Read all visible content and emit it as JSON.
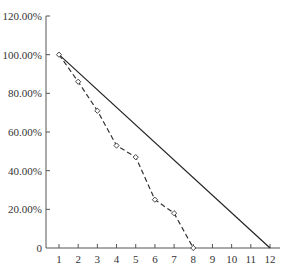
{
  "chart_data": {
    "type": "line",
    "title": "",
    "xlabel": "",
    "ylabel": "",
    "x_ticks": [
      "1",
      "2",
      "3",
      "4",
      "5",
      "6",
      "7",
      "8",
      "9",
      "10",
      "11",
      "12"
    ],
    "y_ticks": [
      "0",
      "20.00%",
      "40.00%",
      "60.00%",
      "80.00%",
      "100.00%",
      "120.00%"
    ],
    "xlim": [
      0.35,
      12.6
    ],
    "ylim": [
      0,
      1.2
    ],
    "grid": false,
    "legend": null,
    "series": [
      {
        "name": "solid",
        "style": "solid",
        "markers": false,
        "x": [
          1,
          12
        ],
        "y": [
          1.0,
          0.0
        ]
      },
      {
        "name": "dashed",
        "style": "dashed",
        "markers": true,
        "marker": "diamond",
        "x": [
          1,
          2,
          3,
          4,
          5,
          6,
          7,
          8
        ],
        "y": [
          1.0,
          0.86,
          0.71,
          0.53,
          0.47,
          0.25,
          0.18,
          0.0
        ]
      }
    ]
  },
  "colors": {
    "axis": "#555555",
    "solid_line": "#222222",
    "dashed_line": "#333333",
    "text": "#333333"
  }
}
